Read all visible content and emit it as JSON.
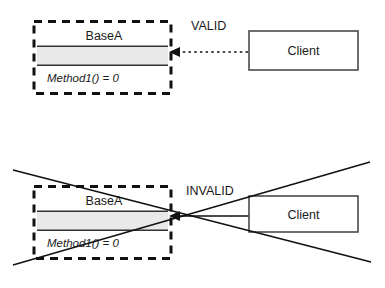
{
  "diagram": {
    "type": "uml-class-diagram",
    "panels": [
      {
        "id": "valid",
        "verdict_label": "VALID",
        "abstract_class": {
          "name": "BaseA",
          "method": "Method1() = 0",
          "stereotype_style": "dashed-abstract"
        },
        "client_class": {
          "name": "Client"
        },
        "relation": {
          "kind": "dependency",
          "line_style": "dotted",
          "direction": "client-to-base"
        }
      },
      {
        "id": "invalid",
        "verdict_label": "INVALID",
        "abstract_class": {
          "name": "BaseA",
          "method": "Method1() = 0",
          "stereotype_style": "dashed-abstract"
        },
        "client_class": {
          "name": "Client"
        },
        "relation": {
          "kind": "association",
          "line_style": "solid",
          "direction": "client-to-base"
        },
        "crossed_out": "true"
      }
    ],
    "colors": {
      "shaded_compartment": "#e9e9e9",
      "frame_stroke": "#111111",
      "box_stroke": "#4a4a4a",
      "text": "#1a1a1a"
    }
  }
}
